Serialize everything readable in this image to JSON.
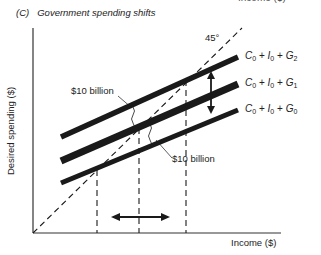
{
  "figure": {
    "cut_top_text": "Income ($)",
    "panel_letter": "(C)",
    "panel_title": "Government spending shifts",
    "y_axis_label": "Desired spending ($)",
    "x_axis_label": "Income ($)",
    "reference_line_label": "45°",
    "curves": [
      {
        "id": "G2",
        "c": "C",
        "c_sub": "0",
        "i": "I",
        "i_sub": "0",
        "g": "G",
        "g_sub": "2"
      },
      {
        "id": "G1",
        "c": "C",
        "c_sub": "0",
        "i": "I",
        "i_sub": "0",
        "g": "G",
        "g_sub": "1"
      },
      {
        "id": "G0",
        "c": "C",
        "c_sub": "0",
        "i": "I",
        "i_sub": "0",
        "g": "G",
        "g_sub": "0"
      }
    ],
    "annotations": {
      "upper_shift": "$10 billion",
      "lower_shift": "$10 billion"
    },
    "colors": {
      "line": "#1a1a1a",
      "axis": "#333333",
      "background": "#ffffff"
    }
  }
}
